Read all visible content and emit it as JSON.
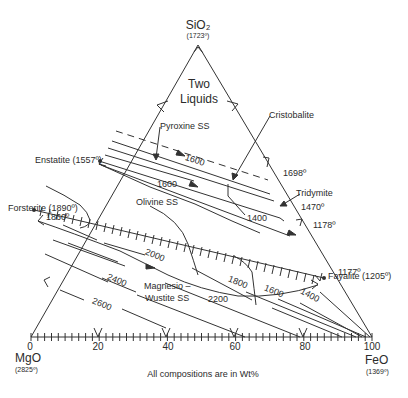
{
  "diagram": {
    "type": "ternary-phase-diagram",
    "footnote": "All compositions are in Wt%",
    "corners": {
      "top": {
        "name": "SiO₂",
        "temp": "(1723º)"
      },
      "left": {
        "name": "MgO",
        "temp": "(2825º)"
      },
      "right": {
        "name": "FeO",
        "temp": "(1369º)"
      }
    },
    "axis_ticks": [
      "0",
      "20",
      "40",
      "60",
      "80",
      "100"
    ],
    "fields": {
      "two_liquids_1": "Two",
      "two_liquids_2": "Liquids",
      "pyroxine": "Pyroxine SS",
      "cristobalite": "Cristobalite",
      "tridymite": "Tridymite",
      "olivine": "Olivine SS",
      "magnesio_1": "Magnesio –",
      "magnesio_2": "Wustite SS"
    },
    "compounds": {
      "enstatite": "Enstatite (1557º)",
      "forsterite": "Forsterite (1890º)",
      "fayalite": "Fayalite (1205º)"
    },
    "points": {
      "t1860": "1860º",
      "t1698": "1698º",
      "t1470": "1470º",
      "t1178": "1178º",
      "t1177": "1177º"
    },
    "isotherms": {
      "i1600a": "1600",
      "i1600b": "1600",
      "i1400a": "1400",
      "i2000": "2000",
      "i1800": "1800",
      "i1600c": "1600",
      "i1400b": "1400",
      "i2400": "2400",
      "i2200": "2200",
      "i2600": "2600"
    }
  }
}
